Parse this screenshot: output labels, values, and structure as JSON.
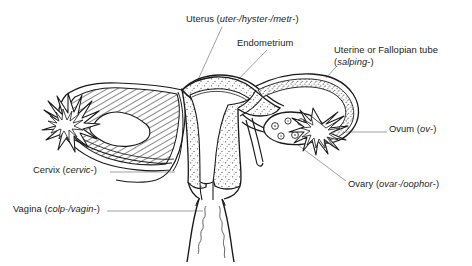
{
  "figure": {
    "kind": "anatomical-line-drawing",
    "background_color": "#ffffff",
    "ink_color": "#1a1a1a",
    "text_color": "#1c1c1c",
    "leader_line_color": "#8a8a8a"
  },
  "labels": {
    "uterus": {
      "name": "Uterus",
      "roots": "(uter-/hyster-/metr-)",
      "line1": "Uterus (uter-/hyster-/metr-)"
    },
    "endometrium": {
      "name": "Endometrium",
      "roots": "",
      "line1": "Endometrium"
    },
    "tube": {
      "name": "Uterine or Fallopian tube",
      "roots": "(salping-)",
      "line1": "Uterine or Fallopian tube",
      "line2": "(salping-)"
    },
    "ovum": {
      "name": "Ovum",
      "roots": "(ov-)",
      "line1": "Ovum (ov-)"
    },
    "ovary": {
      "name": "Ovary",
      "roots": "(ovar-/oophor-)",
      "line1": "Ovary (ovar-/oophor-)"
    },
    "cervix": {
      "name": "Cervix",
      "roots": "(cervic-)",
      "line1": "Cervix (cervic-)"
    },
    "vagina": {
      "name": "Vagina",
      "roots": "(colp-/vagin-)",
      "line1": "Vagina (colp-/vagin-)"
    }
  },
  "structures": {
    "left_side": "cut-away cross-section with diagonal hatching, ovary and fimbriae",
    "center": "uterus body with stippled endometrium and triangular cavity",
    "right_side": "curved Fallopian tube with stippled lining, ovary with follicles, fimbriae",
    "bottom": "vaginal canal with rugae"
  }
}
